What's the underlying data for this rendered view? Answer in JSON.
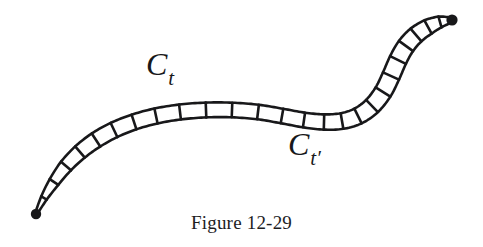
{
  "figure": {
    "caption": "Figure 12-29",
    "type": "mathematical-diagram",
    "background_color": "#ffffff",
    "ink_color": "#18181a",
    "labels": [
      {
        "name": "curve-label-ct",
        "base": "C",
        "subscript": "t",
        "x": 146,
        "y": 48
      },
      {
        "name": "curve-label-ct-prime",
        "base": "C",
        "subscript": "t′",
        "x": 288,
        "y": 128
      }
    ],
    "endpoints": [
      {
        "name": "left-endpoint-dot",
        "x": 36,
        "y": 214,
        "r": 5.2
      },
      {
        "name": "right-endpoint-dot",
        "x": 452,
        "y": 20,
        "r": 5.6
      }
    ],
    "band": {
      "description": "ladder-like ribbon band (homotopy strip) between two endpoint dots",
      "stroke_width": 2.6,
      "rung_count": 27,
      "centerline": [
        [
          36,
          214
        ],
        [
          44,
          198
        ],
        [
          54,
          182
        ],
        [
          66,
          166
        ],
        [
          80,
          152
        ],
        [
          96,
          140
        ],
        [
          114,
          130
        ],
        [
          134,
          122
        ],
        [
          156,
          116
        ],
        [
          180,
          112
        ],
        [
          206,
          110
        ],
        [
          232,
          110
        ],
        [
          258,
          112
        ],
        [
          282,
          116
        ],
        [
          304,
          120
        ],
        [
          324,
          122
        ],
        [
          342,
          121
        ],
        [
          358,
          116
        ],
        [
          372,
          106
        ],
        [
          383,
          92
        ],
        [
          391,
          76
        ],
        [
          398,
          60
        ],
        [
          406,
          46
        ],
        [
          416,
          35
        ],
        [
          428,
          27
        ],
        [
          440,
          22
        ],
        [
          452,
          20
        ]
      ],
      "half_width": [
        0.8,
        3.2,
        5.2,
        6.6,
        7.4,
        7.8,
        7.8,
        7.7,
        7.6,
        7.5,
        7.4,
        7.3,
        7.3,
        7.3,
        7.4,
        7.6,
        7.9,
        8.2,
        8.5,
        8.7,
        8.8,
        8.8,
        8.7,
        8.4,
        7.6,
        5.6,
        2.0
      ]
    }
  }
}
